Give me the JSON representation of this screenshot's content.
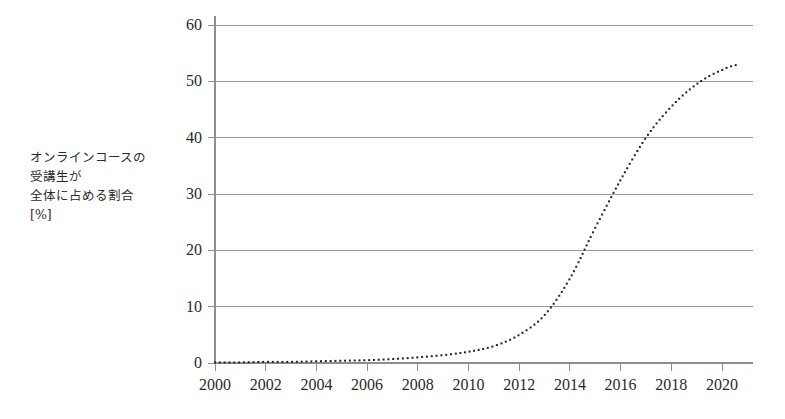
{
  "chart_data": {
    "type": "line",
    "title": "",
    "subtitle": "",
    "xlabel": "",
    "ylabel": "オンラインコースの 受講生が 全体に占める割合 [%]",
    "ylabel_lines": [
      "オンラインコースの",
      "受講生が",
      "全体に占める割合",
      "[%]"
    ],
    "xlim": [
      2000,
      2021
    ],
    "ylim": [
      0,
      60
    ],
    "xticks": [
      2000,
      2002,
      2004,
      2006,
      2008,
      2010,
      2012,
      2014,
      2016,
      2018,
      2020
    ],
    "xtick_labels": [
      "2000",
      "2002",
      "2004",
      "2006",
      "2008",
      "2010",
      "2012",
      "2014",
      "2016",
      "2018",
      "2020"
    ],
    "yticks": [
      0,
      10,
      20,
      30,
      40,
      50,
      60
    ],
    "ytick_labels": [
      "0",
      "10",
      "20",
      "30",
      "40",
      "50",
      "60"
    ],
    "grid": "horizontal",
    "legend": "none",
    "line_style": "dotted",
    "marker": "square",
    "marker_size_px": 2,
    "series_color": "#232323",
    "grid_color": "#9a9a9a",
    "axis_color": "#8e8e8e",
    "series": [
      {
        "name": "オンラインコース受講生比率",
        "x": [
          2000,
          2001,
          2002,
          2003,
          2004,
          2005,
          2006,
          2007,
          2008,
          2009,
          2010,
          2011,
          2012,
          2013,
          2014,
          2015,
          2016,
          2017,
          2018,
          2019,
          2020,
          2020.7
        ],
        "values": [
          0.1,
          0.1,
          0.2,
          0.2,
          0.3,
          0.4,
          0.5,
          0.7,
          1.0,
          1.4,
          2.0,
          3.0,
          5.0,
          8.5,
          15.0,
          24.0,
          32.5,
          40.0,
          45.5,
          49.5,
          52.0,
          53.0
        ]
      }
    ],
    "annotations": []
  },
  "plot_geometry": {
    "x_left_px": 215,
    "x_right_px": 753,
    "y_zero_px": 363,
    "y_top_px": 25
  }
}
